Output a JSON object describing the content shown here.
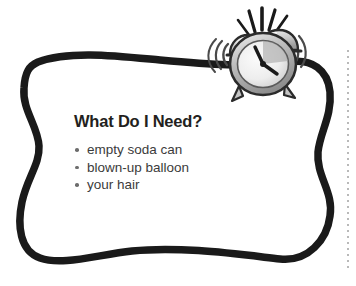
{
  "page": {
    "background_color": "#ffffff",
    "frame_color": "#1a1a1a"
  },
  "callout": {
    "heading": "What Do I Need?",
    "items": [
      {
        "label": "empty soda can"
      },
      {
        "label": "blown-up balloon"
      },
      {
        "label": "your hair"
      }
    ],
    "heading_color": "#231f20",
    "item_color": "#3b3b3b",
    "bullet_color": "#6d6d6d"
  },
  "decoration": {
    "clock_icon": "alarm-clock-icon",
    "clock_body_color": "#d0d0d0",
    "clock_outline_color": "#2b2b2b",
    "clock_face_color": "#e9e9e9",
    "ring_lines_color": "#1a1a1a",
    "margin_rule": "dotted-vertical-rule",
    "margin_rule_color": "#b9b9b9"
  }
}
